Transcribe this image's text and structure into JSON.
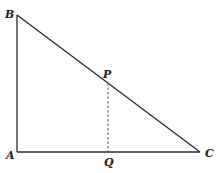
{
  "diagram": {
    "type": "right-triangle",
    "colors": {
      "stroke": "#2a2a2a",
      "dashed": "#555555",
      "background": "#ffffff"
    },
    "points": {
      "A": {
        "label": "A",
        "x": 17,
        "y": 152
      },
      "B": {
        "label": "B",
        "x": 17,
        "y": 15
      },
      "C": {
        "label": "C",
        "x": 200,
        "y": 152
      },
      "P": {
        "label": "P",
        "x": 108,
        "y": 83
      },
      "Q": {
        "label": "Q",
        "x": 108,
        "y": 152
      }
    },
    "segments": [
      {
        "from": "A",
        "to": "B",
        "style": "solid"
      },
      {
        "from": "A",
        "to": "C",
        "style": "solid"
      },
      {
        "from": "B",
        "to": "C",
        "style": "solid"
      },
      {
        "from": "P",
        "to": "Q",
        "style": "dashed"
      }
    ]
  }
}
